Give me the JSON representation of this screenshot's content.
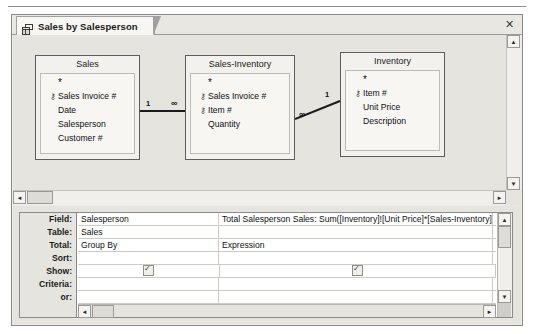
{
  "window": {
    "close_label": "✕",
    "tab": {
      "label": "Sales by Salesperson",
      "icon": "query-design-icon"
    }
  },
  "diagram": {
    "tables": [
      {
        "name": "Sales",
        "fields": [
          {
            "label": "*",
            "key": false
          },
          {
            "label": "Sales Invoice #",
            "key": true
          },
          {
            "label": "Date",
            "key": false
          },
          {
            "label": "Salesperson",
            "key": false
          },
          {
            "label": "Customer #",
            "key": false
          }
        ]
      },
      {
        "name": "Sales-Inventory",
        "fields": [
          {
            "label": "*",
            "key": false
          },
          {
            "label": "Sales Invoice #",
            "key": true
          },
          {
            "label": "Item #",
            "key": true
          },
          {
            "label": "Quantity",
            "key": false
          }
        ]
      },
      {
        "name": "Inventory",
        "fields": [
          {
            "label": "*",
            "key": false
          },
          {
            "label": "Item #",
            "key": true
          },
          {
            "label": "Unit Price",
            "key": false
          },
          {
            "label": "Description",
            "key": false
          }
        ]
      }
    ],
    "joins": [
      {
        "left_cardinality": "1",
        "right_cardinality": "∞"
      },
      {
        "left_cardinality": "∞",
        "right_cardinality": "1"
      }
    ],
    "key_glyph": "⚷"
  },
  "grid": {
    "row_labels": [
      "Field:",
      "Table:",
      "Total:",
      "Sort:",
      "Show:",
      "Criteria:",
      "or:"
    ],
    "columns": [
      {
        "field": "Salesperson",
        "table": "Sales",
        "total": "Group By",
        "sort": "",
        "show": true,
        "criteria": "",
        "or": ""
      },
      {
        "field": "Total Salesperson Sales: Sum([Inventory]![Unit Price]*[Sales-Inventory]![Quantity])",
        "table": "",
        "total": "Expression",
        "sort": "",
        "show": true,
        "criteria": "",
        "or": ""
      },
      {
        "field": "",
        "table": "",
        "total": "",
        "sort": "",
        "show": false,
        "criteria": "",
        "or": ""
      }
    ]
  },
  "scrollbars": {
    "up_arrow": "▲",
    "down_arrow": "▼",
    "left_arrow": "◄",
    "right_arrow": "►"
  },
  "colors": {
    "window_bg": "#e6e4de",
    "tab_active": "#f7f6f3",
    "table_box": "#f7f6f3",
    "border": "#5d5d5d",
    "grid_bg": "#ffffff"
  }
}
